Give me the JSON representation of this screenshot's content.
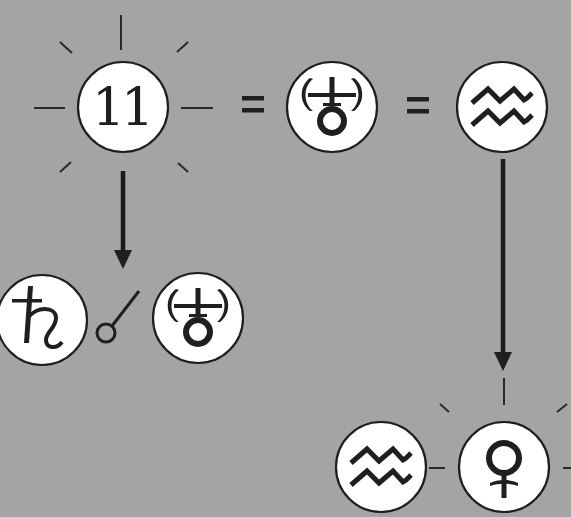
{
  "diagram": {
    "colors": {
      "background": "#a4a4a4",
      "disc_fill": "#ffffff",
      "ink": "#1f1f1f"
    },
    "top_row": {
      "nodes": [
        {
          "id": "house-11",
          "label": "11",
          "symbol": "house-number",
          "radiant": true
        },
        {
          "id": "uranus",
          "label": "♅",
          "symbol": "uranus-glyph"
        },
        {
          "id": "aquarius",
          "label": "♒",
          "symbol": "aquarius-glyph"
        }
      ],
      "operators": [
        "=",
        "="
      ]
    },
    "arrows": [
      {
        "from": "house-11",
        "to": "saturn-opposition-uranus",
        "direction": "down"
      },
      {
        "from": "aquarius",
        "to": "venus",
        "direction": "down"
      }
    ],
    "bottom_left": {
      "nodes": [
        {
          "id": "saturn",
          "label": "♄",
          "symbol": "saturn-glyph"
        },
        {
          "id": "uranus-2",
          "label": "♅",
          "symbol": "uranus-glyph"
        }
      ],
      "aspect": {
        "label": "☍",
        "name": "opposition"
      }
    },
    "bottom_right": {
      "nodes": [
        {
          "id": "aquarius-2",
          "label": "♒",
          "symbol": "aquarius-glyph"
        },
        {
          "id": "venus",
          "label": "♀",
          "symbol": "venus-glyph",
          "radiant": true
        }
      ]
    }
  }
}
